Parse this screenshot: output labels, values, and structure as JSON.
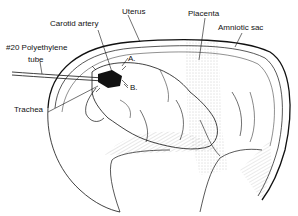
{
  "diagram": {
    "labels": {
      "uterus": "Uterus",
      "placenta": "Placenta",
      "amniotic_sac": "Amniotic sac",
      "carotid_artery": "Carotid artery",
      "tube_line1": "#20 Polyethylene",
      "tube_line2": "tube",
      "trachea": "Trachea",
      "point_a": "A.",
      "point_b": "B."
    },
    "colors": {
      "ink": "#111111",
      "background": "#ffffff",
      "stipple": "#9a9a9a"
    }
  }
}
